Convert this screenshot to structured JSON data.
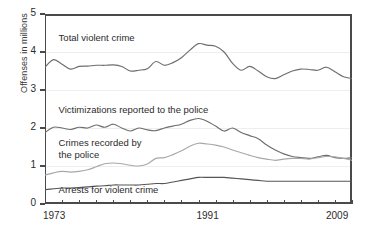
{
  "chart_data": {
    "type": "line",
    "title": "",
    "xlabel": "",
    "ylabel": "Offenses in millions",
    "xlim": [
      1973,
      2009
    ],
    "ylim": [
      0,
      5
    ],
    "ytick_labels": [
      "0",
      "1",
      "2",
      "3",
      "4",
      "5"
    ],
    "ytick_values": [
      0,
      1,
      2,
      3,
      4,
      5
    ],
    "xtick_labels": [
      "1973",
      "1991",
      "2009"
    ],
    "xtick_values": [
      1973,
      1991,
      2009
    ],
    "grid": true,
    "legend_position": "inline-annotations",
    "x": [
      1973,
      1974,
      1975,
      1976,
      1977,
      1978,
      1979,
      1980,
      1981,
      1982,
      1983,
      1984,
      1985,
      1986,
      1987,
      1988,
      1989,
      1990,
      1991,
      1992,
      1993,
      1994,
      1995,
      1996,
      1997,
      1998,
      1999,
      2000,
      2001,
      2002,
      2003,
      2004,
      2005,
      2006,
      2007,
      2008,
      2009
    ],
    "series": [
      {
        "name": "Total violent crime",
        "color": "#6e6e6e",
        "values": [
          3.6,
          3.8,
          3.68,
          3.55,
          3.62,
          3.63,
          3.65,
          3.65,
          3.66,
          3.62,
          3.5,
          3.52,
          3.56,
          3.75,
          3.65,
          3.72,
          3.85,
          4.05,
          4.22,
          4.18,
          4.15,
          4.0,
          3.7,
          3.52,
          3.62,
          3.5,
          3.35,
          3.3,
          3.4,
          3.5,
          3.55,
          3.54,
          3.52,
          3.6,
          3.48,
          3.35,
          3.3
        ]
      },
      {
        "name": "Victimizations reported to the police",
        "color": "#6e6e6e",
        "values": [
          1.88,
          2.02,
          2.0,
          1.96,
          2.02,
          2.0,
          2.08,
          2.02,
          2.1,
          2.0,
          1.92,
          2.0,
          1.95,
          1.93,
          2.0,
          2.05,
          2.1,
          2.2,
          2.25,
          2.18,
          2.05,
          1.92,
          2.0,
          1.88,
          1.8,
          1.72,
          1.55,
          1.42,
          1.32,
          1.25,
          1.22,
          1.2,
          1.24,
          1.28,
          1.22,
          1.2,
          1.22
        ]
      },
      {
        "name": "Crimes recorded by the police",
        "color": "#a8a8a8",
        "values": [
          0.76,
          0.82,
          0.86,
          0.84,
          0.86,
          0.9,
          0.98,
          1.06,
          1.08,
          1.06,
          1.02,
          1.0,
          1.05,
          1.2,
          1.22,
          1.3,
          1.4,
          1.52,
          1.6,
          1.58,
          1.55,
          1.5,
          1.42,
          1.35,
          1.28,
          1.22,
          1.18,
          1.15,
          1.18,
          1.2,
          1.2,
          1.18,
          1.22,
          1.25,
          1.24,
          1.2,
          1.15
        ]
      },
      {
        "name": "Arrests for violent crime",
        "color": "#555555",
        "values": [
          0.38,
          0.4,
          0.42,
          0.42,
          0.43,
          0.45,
          0.47,
          0.48,
          0.5,
          0.5,
          0.5,
          0.5,
          0.52,
          0.54,
          0.54,
          0.58,
          0.62,
          0.66,
          0.7,
          0.7,
          0.7,
          0.7,
          0.68,
          0.66,
          0.64,
          0.62,
          0.6,
          0.6,
          0.6,
          0.6,
          0.6,
          0.6,
          0.6,
          0.6,
          0.6,
          0.6,
          0.6
        ]
      }
    ],
    "annotations": [
      {
        "text": "Total violent crime",
        "x": 1974.6,
        "y": 4.3
      },
      {
        "text": "Victimizations reported to the police",
        "x": 1974.6,
        "y": 2.4
      },
      {
        "text": "Crimes recorded by\nthe police",
        "x": 1974.6,
        "y": 1.52
      },
      {
        "text": "Arrests for violent crime",
        "x": 1974.6,
        "y": 0.28
      }
    ]
  },
  "axis": {
    "y_title": "Offenses in millions"
  },
  "colors": {
    "frame": "#4a4a4a",
    "grid": "#eeeeee",
    "text": "#2b2b2b",
    "background": "#ffffff"
  }
}
